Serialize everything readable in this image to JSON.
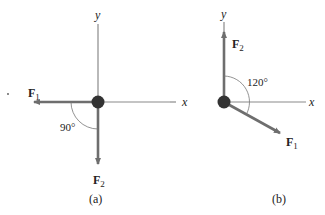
{
  "figure_a": {
    "axis_y_label": "y",
    "axis_x_label": "x",
    "force1_label": "F",
    "force1_sub": "1",
    "force2_label": "F",
    "force2_sub": "2",
    "angle_label": "90°",
    "caption": "(a)"
  },
  "figure_b": {
    "axis_y_label": "y",
    "axis_x_label": "x",
    "force1_label": "F",
    "force1_sub": "1",
    "force2_label": "F",
    "force2_sub": "2",
    "angle_label": "120°",
    "caption": "(b)"
  },
  "colors": {
    "axis": "#8a8a8a",
    "force": "#6e6e6e",
    "particle": "#333333",
    "text": "#222222"
  }
}
